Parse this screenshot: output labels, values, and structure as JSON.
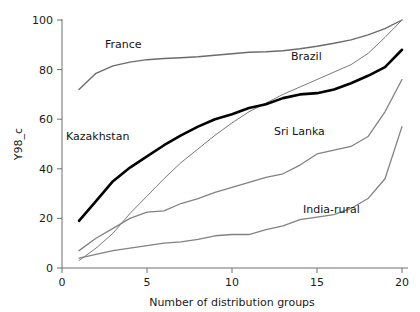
{
  "chart_data": {
    "type": "line",
    "title": "",
    "xlabel": "Number of distribution groups",
    "ylabel": "Y98_c",
    "xlim": [
      0,
      20
    ],
    "ylim": [
      0,
      100
    ],
    "xticks": [
      0,
      5,
      10,
      15,
      20
    ],
    "yticks": [
      0,
      20,
      40,
      60,
      80,
      100
    ],
    "grid": false,
    "legend_position": "inline-annotations",
    "x": [
      1,
      2,
      3,
      4,
      5,
      6,
      7,
      8,
      9,
      10,
      11,
      12,
      13,
      14,
      15,
      16,
      17,
      18,
      19,
      20
    ],
    "series": [
      {
        "name": "France",
        "color": "#6b6b6b",
        "width": 1.4,
        "values": [
          72,
          78.5,
          81.5,
          83,
          84,
          84.5,
          84.8,
          85.2,
          85.8,
          86.4,
          87,
          87.2,
          87.6,
          88.4,
          89.4,
          90.6,
          92,
          94,
          96.5,
          100
        ]
      },
      {
        "name": "Brazil",
        "color": "#7a7a7a",
        "width": 1.0,
        "values": [
          3,
          8,
          14,
          22,
          29,
          36,
          42.5,
          48,
          53.5,
          58.5,
          63,
          66.5,
          70,
          73,
          76,
          79,
          82,
          86.5,
          93,
          100
        ]
      },
      {
        "name": "Kazakhstan",
        "color": "#000000",
        "width": 2.6,
        "values": [
          19,
          27,
          35,
          40.5,
          45,
          49.5,
          53.5,
          57,
          60,
          62,
          64.5,
          66,
          68.5,
          70,
          70.5,
          72,
          74.5,
          77.5,
          81,
          88
        ]
      },
      {
        "name": "Sri Lanka",
        "color": "#828282",
        "width": 1.3,
        "values": [
          7,
          12,
          16,
          20,
          22.5,
          23,
          26,
          28,
          30.5,
          32.5,
          34.5,
          36.5,
          38,
          41.5,
          46,
          47.5,
          49,
          53,
          63,
          76
        ]
      },
      {
        "name": "India-rural",
        "color": "#828282",
        "width": 1.3,
        "values": [
          4,
          5.5,
          7,
          8,
          9,
          10,
          10.5,
          11.5,
          13,
          13.5,
          13.5,
          15.5,
          17,
          19.5,
          20.5,
          21.5,
          24,
          28,
          36,
          57
        ]
      }
    ],
    "annotations": [
      {
        "text": "France",
        "x_px": 105,
        "y_px": 48
      },
      {
        "text": "Kazakhstan",
        "x_px": 66,
        "y_px": 140
      },
      {
        "text": "Brazil",
        "x_px": 291,
        "y_px": 60
      },
      {
        "text": "Sri Lanka",
        "x_px": 274,
        "y_px": 135
      },
      {
        "text": "India-rural",
        "x_px": 303,
        "y_px": 213
      }
    ]
  },
  "axes": {
    "y_title": "Y98_c",
    "x_title": "Number of distribution groups",
    "y_tick_labels": [
      "0",
      "20",
      "40",
      "60",
      "80",
      "100"
    ],
    "x_tick_labels": [
      "0",
      "5",
      "10",
      "15",
      "20"
    ]
  }
}
